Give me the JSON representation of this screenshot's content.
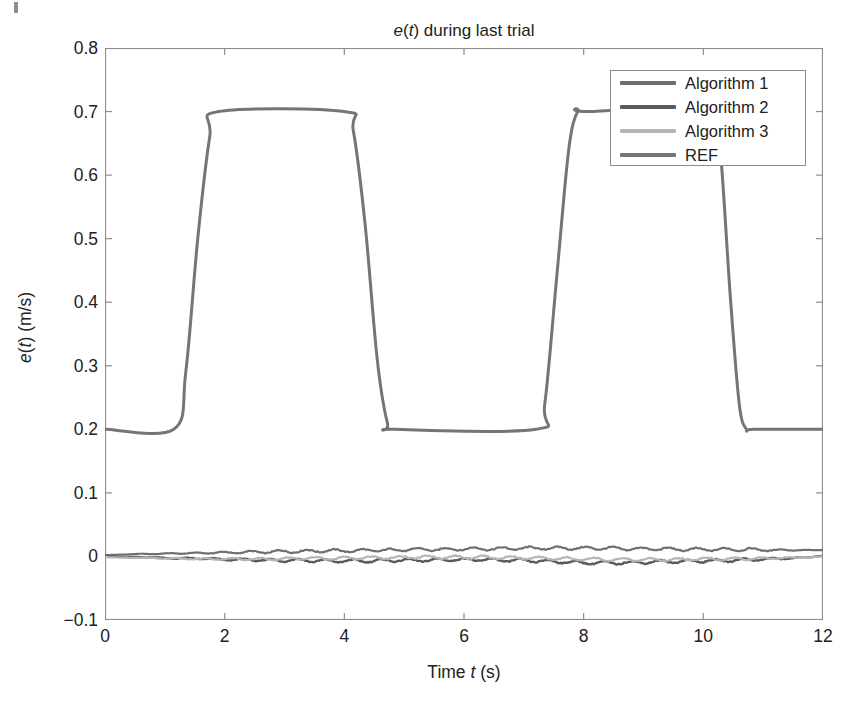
{
  "figure": {
    "background_color": "#ffffff",
    "axis_color": "#8d8d8d",
    "text_color": "#222222"
  },
  "chart_data": {
    "type": "line",
    "title": "e(t) during last trial",
    "title_parts": {
      "var1": "e",
      "mid": "(",
      "var2": "t",
      "tail": ") during last trial"
    },
    "xlabel": "Time t (s)",
    "xlabel_parts": {
      "pre": "Time ",
      "var": "t",
      "post": " (s)"
    },
    "ylabel": "e(t) (m/s)",
    "ylabel_parts": {
      "var1": "e",
      "p1": "(",
      "var2": "t",
      "p2": ") (m/s)"
    },
    "xlim": [
      0,
      12
    ],
    "ylim": [
      -0.1,
      0.8
    ],
    "xticks": [
      0,
      2,
      4,
      6,
      8,
      10,
      12
    ],
    "xticklabels": [
      "0",
      "2",
      "4",
      "6",
      "8",
      "10",
      "12"
    ],
    "yticks": [
      -0.1,
      0,
      0.1,
      0.2,
      0.3,
      0.4,
      0.5,
      0.6,
      0.7,
      0.8
    ],
    "yticklabels": [
      "-0.1",
      "0",
      "0.1",
      "0.2",
      "0.3",
      "0.4",
      "0.5",
      "0.6",
      "0.7",
      "0.8"
    ],
    "grid": false,
    "legend_position": "upper right",
    "series": [
      {
        "name": "Algorithm 1",
        "color": "#6f6f6f",
        "width": 2.2,
        "description": "small noisy error signal oscillating about 0, drifting slightly positive to about +0.012 by t=9",
        "x": [
          0,
          0.3,
          0.6,
          0.9,
          1.2,
          1.5,
          1.8,
          2.1,
          2.4,
          2.7,
          3.0,
          3.3,
          3.6,
          3.9,
          4.2,
          4.5,
          4.8,
          5.1,
          5.4,
          5.7,
          6.0,
          6.3,
          6.6,
          6.9,
          7.2,
          7.5,
          7.8,
          8.1,
          8.4,
          8.7,
          9.0,
          9.3,
          9.6,
          9.9,
          10.2,
          10.5,
          10.8,
          11.1,
          11.4,
          11.7,
          12.0
        ],
        "y": [
          0.002,
          0.003,
          0.004,
          0.004,
          0.005,
          0.005,
          0.006,
          0.006,
          0.007,
          0.007,
          0.008,
          0.008,
          0.009,
          0.009,
          0.009,
          0.01,
          0.01,
          0.011,
          0.011,
          0.011,
          0.012,
          0.012,
          0.012,
          0.013,
          0.013,
          0.013,
          0.013,
          0.013,
          0.013,
          0.012,
          0.012,
          0.012,
          0.011,
          0.011,
          0.011,
          0.011,
          0.011,
          0.01,
          0.01,
          0.01,
          0.01
        ]
      },
      {
        "name": "Algorithm 2",
        "color": "#5a5a5a",
        "width": 2.4,
        "description": "small noisy error signal oscillating about 0, drifting slightly negative to about -0.010 near t=8 then recovering",
        "x": [
          0,
          0.3,
          0.6,
          0.9,
          1.2,
          1.5,
          1.8,
          2.1,
          2.4,
          2.7,
          3.0,
          3.3,
          3.6,
          3.9,
          4.2,
          4.5,
          4.8,
          5.1,
          5.4,
          5.7,
          6.0,
          6.3,
          6.6,
          6.9,
          7.2,
          7.5,
          7.8,
          8.1,
          8.4,
          8.7,
          9.0,
          9.3,
          9.6,
          9.9,
          10.2,
          10.5,
          10.8,
          11.1,
          11.4,
          11.7,
          12.0
        ],
        "y": [
          0.0,
          -0.001,
          -0.001,
          -0.002,
          -0.003,
          -0.003,
          -0.004,
          -0.005,
          -0.005,
          -0.006,
          -0.006,
          -0.006,
          -0.007,
          -0.007,
          -0.007,
          -0.007,
          -0.006,
          -0.006,
          -0.006,
          -0.005,
          -0.005,
          -0.005,
          -0.006,
          -0.006,
          -0.007,
          -0.008,
          -0.009,
          -0.01,
          -0.01,
          -0.01,
          -0.009,
          -0.008,
          -0.008,
          -0.007,
          -0.007,
          -0.006,
          -0.005,
          -0.004,
          -0.003,
          -0.002,
          0.001
        ]
      },
      {
        "name": "Algorithm 3",
        "color": "#b5b5b5",
        "width": 2.2,
        "description": "light grey noisy error signal oscillating about 0, close to zero throughout",
        "x": [
          0,
          0.3,
          0.6,
          0.9,
          1.2,
          1.5,
          1.8,
          2.1,
          2.4,
          2.7,
          3.0,
          3.3,
          3.6,
          3.9,
          4.2,
          4.5,
          4.8,
          5.1,
          5.4,
          5.7,
          6.0,
          6.3,
          6.6,
          6.9,
          7.2,
          7.5,
          7.8,
          8.1,
          8.4,
          8.7,
          9.0,
          9.3,
          9.6,
          9.9,
          10.2,
          10.5,
          10.8,
          11.1,
          11.4,
          11.7,
          12.0
        ],
        "y": [
          -0.001,
          -0.002,
          -0.002,
          -0.003,
          -0.003,
          -0.004,
          -0.004,
          -0.004,
          -0.004,
          -0.004,
          -0.004,
          -0.003,
          -0.003,
          -0.003,
          -0.002,
          -0.002,
          -0.002,
          -0.001,
          -0.001,
          -0.001,
          -0.001,
          -0.001,
          -0.002,
          -0.002,
          -0.003,
          -0.003,
          -0.004,
          -0.004,
          -0.005,
          -0.005,
          -0.005,
          -0.005,
          -0.005,
          -0.004,
          -0.004,
          -0.004,
          -0.003,
          -0.003,
          -0.002,
          -0.002,
          0.0
        ]
      },
      {
        "name": "REF",
        "color": "#757575",
        "width": 3.0,
        "description": "smooth trapezoidal reference: holds 0.2, ramps to 0.7 between t=1.15 and t=1.80, holds 0.7 to t=4.05, ramps down to 0.2 by t=4.75, holds to t=7.25, ramps to 0.7 by t=7.90, holds to t=10.20, ramps down to 0.2 by t=10.70, holds to t=12",
        "x": [
          0,
          1.15,
          1.35,
          1.55,
          1.75,
          1.9,
          4.0,
          4.15,
          4.35,
          4.55,
          4.72,
          4.85,
          7.2,
          7.35,
          7.55,
          7.75,
          7.9,
          8.05,
          10.18,
          10.3,
          10.45,
          10.6,
          10.72,
          10.85,
          12.0
        ],
        "y": [
          0.2,
          0.2,
          0.29,
          0.5,
          0.66,
          0.7,
          0.7,
          0.67,
          0.52,
          0.31,
          0.21,
          0.2,
          0.2,
          0.24,
          0.44,
          0.64,
          0.7,
          0.7,
          0.7,
          0.62,
          0.41,
          0.24,
          0.2,
          0.2,
          0.2
        ]
      }
    ]
  },
  "legend": {
    "items": [
      {
        "label": "Algorithm 1",
        "color": "#6f6f6f"
      },
      {
        "label": "Algorithm 2",
        "color": "#5a5a5a"
      },
      {
        "label": "Algorithm 3",
        "color": "#b5b5b5"
      },
      {
        "label": "REF",
        "color": "#757575"
      }
    ]
  }
}
